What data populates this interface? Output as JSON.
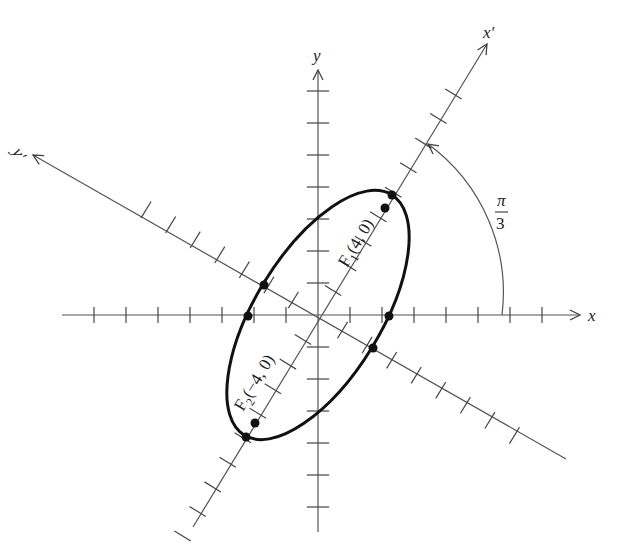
{
  "figure": {
    "title": "",
    "top_cut_text": "",
    "axes": {
      "x_label": "x",
      "y_label": "y",
      "x_prime_label": "x′",
      "y_prime_label": "y′"
    },
    "rotation_angle_label_num": "π",
    "rotation_angle_label_den": "3",
    "foci": [
      {
        "name": "F",
        "sub": "1",
        "coords": "(4, 0)"
      },
      {
        "name": "F",
        "sub": "2",
        "coords": "(−4, 0)"
      }
    ]
  },
  "chart_data": {
    "type": "diagram",
    "rotation_angle": "π/3",
    "ellipse": {
      "center": [
        0,
        0
      ],
      "semi_major": 4.47,
      "semi_minor": 2,
      "equation_rotated_frame": "x′²/20 + y′²/4 = 1"
    },
    "foci": [
      {
        "label": "F1(4, 0)",
        "x_prime": 4,
        "y_prime": 0
      },
      {
        "label": "F2(−4, 0)",
        "x_prime": -4,
        "y_prime": 0
      }
    ],
    "marked_points": [
      "vertex (+a on x′)",
      "vertex (−a on x′)",
      "co-vertex (+b on y′)",
      "co-vertex (−b on y′)",
      "x-intercept right",
      "x-intercept left",
      "F1",
      "F2"
    ],
    "x_ticks_left": 7,
    "x_ticks_right": 7,
    "y_ticks_up": 7,
    "y_ticks_down": 6,
    "grid": false
  }
}
